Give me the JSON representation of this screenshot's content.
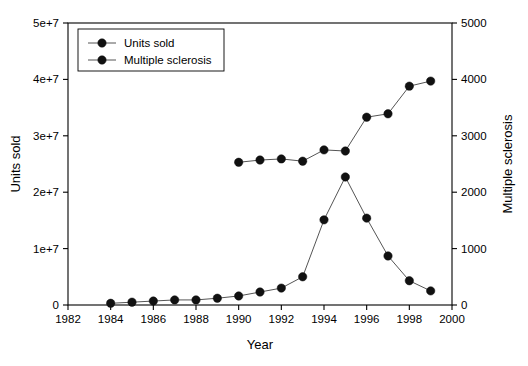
{
  "chart_data": {
    "type": "line",
    "title": "",
    "xlabel": "Year",
    "ylabel": "Units sold",
    "y2label": "Multiple sclerosis",
    "xlim": [
      1982,
      2000
    ],
    "ylim": [
      0,
      50000000
    ],
    "y2lim": [
      0,
      5000
    ],
    "grid": false,
    "legend_position": "top-left",
    "x_ticks": [
      "1982",
      "1984",
      "1986",
      "1988",
      "1990",
      "1992",
      "1994",
      "1996",
      "1998",
      "2000"
    ],
    "x_tick_values": [
      1982,
      1984,
      1986,
      1988,
      1990,
      1992,
      1994,
      1996,
      1998,
      2000
    ],
    "y_ticks": [
      "0",
      "1e+7",
      "2e+7",
      "3e+7",
      "4e+7",
      "5e+7"
    ],
    "y_tick_values": [
      0,
      10000000,
      20000000,
      30000000,
      40000000,
      50000000
    ],
    "y2_ticks": [
      "0",
      "1000",
      "2000",
      "3000",
      "4000",
      "5000"
    ],
    "y2_tick_values": [
      0,
      1000,
      2000,
      3000,
      4000,
      5000
    ],
    "series": [
      {
        "name": "Units sold",
        "axis": "left",
        "marker": "filled-circle",
        "x": [
          1984,
          1985,
          1986,
          1987,
          1988,
          1989,
          1990,
          1991,
          1992,
          1993,
          1994,
          1995,
          1996,
          1997,
          1998,
          1999
        ],
        "values": [
          300000,
          500000,
          700000,
          900000,
          900000,
          1200000,
          1600000,
          2300000,
          3000000,
          5000000,
          15100000,
          22700000,
          15400000,
          8700000,
          4300000,
          2500000
        ]
      },
      {
        "name": "Multiple sclerosis",
        "axis": "right",
        "marker": "filled-circle",
        "x": [
          1990,
          1991,
          1992,
          1993,
          1994,
          1995,
          1996,
          1997,
          1998,
          1999
        ],
        "values": [
          2530,
          2570,
          2590,
          2550,
          2750,
          2730,
          3330,
          3390,
          3880,
          3970
        ]
      }
    ],
    "legend_entries": [
      "Units sold",
      "Multiple sclerosis"
    ],
    "colors": {
      "series1": "#111111",
      "series2": "#111111",
      "line": "#555555",
      "axis": "#000000"
    }
  }
}
